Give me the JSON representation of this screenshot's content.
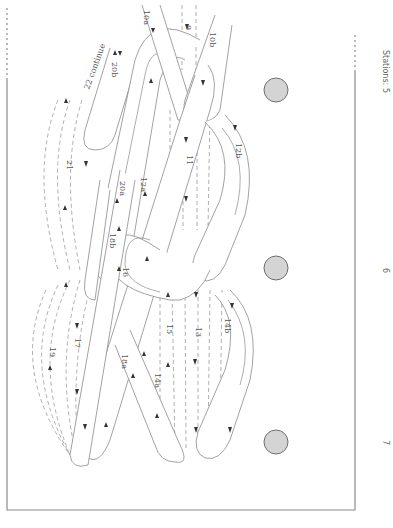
{
  "stations": {
    "title": "Stations:",
    "items": [
      {
        "label": "5",
        "y": 90
      },
      {
        "label": "6",
        "y": 268
      },
      {
        "label": "7",
        "y": 442
      }
    ]
  },
  "labels": {
    "s9": "9",
    "s10a": "10a",
    "s10b": "10b",
    "s11": "11",
    "s12a": "12a",
    "s12b": "12b",
    "s13": "13",
    "s14a": "14a",
    "s14b": "14b",
    "s15": "15",
    "s16": "16",
    "s17": "17",
    "s18a": "18a",
    "s18b": "18b",
    "s19": "19",
    "s20a": "20a",
    "s20b": "20b",
    "s21": "21",
    "s22": "22 continue"
  },
  "colors": {
    "line": "#8a8a8a",
    "station_fill": "#d4d4d4",
    "station_stroke": "#6e6e6e",
    "frame": "#8c8c8c"
  }
}
